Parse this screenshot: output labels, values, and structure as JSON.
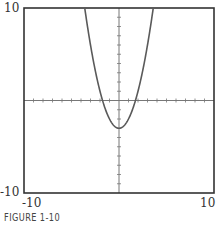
{
  "chart_data": {
    "type": "line",
    "title": "",
    "caption": "FIGURE 1-10",
    "function": "y = x^2 - 3",
    "xlabel": "",
    "ylabel": "",
    "xlim": [
      -10,
      10
    ],
    "ylim": [
      -10,
      10
    ],
    "x_tick_labels": [
      "-10",
      "10"
    ],
    "y_tick_labels": [
      "10",
      "-10"
    ],
    "tick_spacing": 1,
    "grid": false,
    "series": [
      {
        "name": "parabola",
        "x": [
          -3.6,
          -3,
          -2,
          -1.73,
          -1,
          0,
          1,
          1.73,
          2,
          3,
          3.6
        ],
        "y": [
          9.96,
          6,
          1,
          0,
          -2,
          -3,
          -2,
          0,
          1,
          6,
          9.96
        ]
      }
    ],
    "colors": {
      "curve": "#5a5a5a",
      "axes": "#777777",
      "frame": "#333333"
    }
  },
  "labels": {
    "y_top": "10",
    "y_bottom": "-10",
    "x_left": "-10",
    "x_right": "10",
    "caption": "FIGURE 1-10"
  }
}
